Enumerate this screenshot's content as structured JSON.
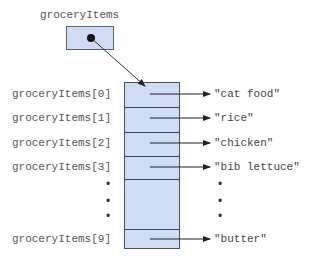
{
  "diagram": {
    "variable_name": "groceryItems",
    "pointer": {
      "from": "groceryItems",
      "to": "array"
    },
    "rows": [
      {
        "label": "groceryItems[0]",
        "value": "\"cat food\""
      },
      {
        "label": "groceryItems[1]",
        "value": "\"rice\""
      },
      {
        "label": "groceryItems[2]",
        "value": "\"chicken\""
      },
      {
        "label": "groceryItems[3]",
        "value": "\"bib lettuce\""
      },
      {
        "label": "groceryItems[9]",
        "value": "\"butter\""
      }
    ],
    "ellipsis": "•",
    "colors": {
      "cell_fill": "#cfdcf3",
      "border": "#4a5468",
      "text": "#555555"
    }
  }
}
